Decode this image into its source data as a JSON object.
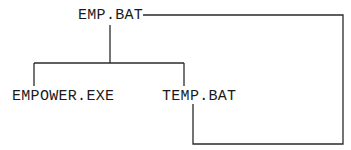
{
  "diagram": {
    "type": "tree",
    "nodes": [
      {
        "id": "root",
        "label": "EMP.BAT"
      },
      {
        "id": "child1",
        "label": "EMPOWER.EXE"
      },
      {
        "id": "child2",
        "label": "TEMP.BAT"
      }
    ],
    "edges": [
      {
        "from": "root",
        "to": "child1"
      },
      {
        "from": "root",
        "to": "child2"
      },
      {
        "from": "child2",
        "to": "root",
        "style": "loop-back"
      }
    ],
    "line_color": "#2a2a2a"
  }
}
